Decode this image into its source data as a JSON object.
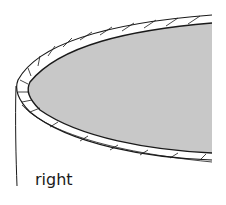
{
  "diagram": {
    "label": "right",
    "colors": {
      "fill": "#c8c8c8",
      "stroke": "#1a1a1a",
      "background": "#ffffff"
    }
  }
}
